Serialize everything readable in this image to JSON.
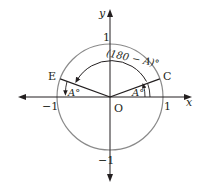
{
  "diagram": {
    "type": "unit-circle",
    "axes": {
      "x_label": "x",
      "y_label": "y"
    },
    "ticks": {
      "x_pos": "1",
      "x_neg": "−1",
      "y_pos": "1",
      "y_neg": "−1"
    },
    "origin_label": "O",
    "points": {
      "C": "C",
      "E": "E"
    },
    "angle_labels": {
      "at_C": "A°",
      "at_E": "A°",
      "arc": "(180 − A)°"
    },
    "colors": {
      "circle": "#8a8a8a",
      "line": "#231f20",
      "axis": "#231f20"
    }
  }
}
